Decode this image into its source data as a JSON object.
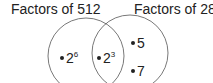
{
  "diagram": {
    "type": "venn",
    "sets": [
      {
        "label": "Factors of 512",
        "only_items": [
          {
            "base": "2",
            "exp": "6"
          }
        ]
      },
      {
        "label": "Factors of 280",
        "only_items": [
          {
            "base": "5",
            "exp": ""
          },
          {
            "base": "7",
            "exp": ""
          }
        ]
      }
    ],
    "intersection": [
      {
        "base": "2",
        "exp": "3"
      }
    ]
  },
  "colors": {
    "stroke": "#555555",
    "text": "#222222"
  }
}
